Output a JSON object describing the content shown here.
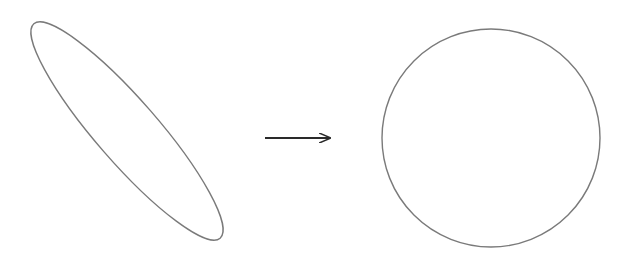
{
  "diagram": {
    "stroke_color": "#7a7a7a",
    "arrow_color": "#2a2a2a",
    "background": "#ffffff",
    "shapes": [
      {
        "id": "ellipse",
        "type": "ellipse",
        "cx": 127,
        "cy": 131,
        "rx": 140,
        "ry": 32,
        "rotation_deg": 49
      },
      {
        "id": "arrow",
        "type": "arrow",
        "x1": 265,
        "y1": 138,
        "x2": 330,
        "y2": 138
      },
      {
        "id": "circle",
        "type": "circle",
        "cx": 491,
        "cy": 138,
        "r": 109
      }
    ],
    "labels": {
      "ellipse": "ellipse",
      "arrow": "transforms to",
      "circle": "circle"
    }
  }
}
